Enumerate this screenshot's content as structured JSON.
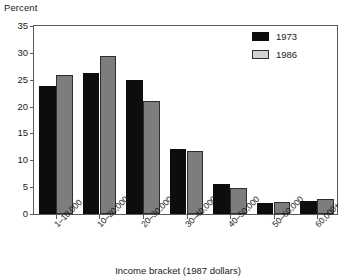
{
  "chart_data": {
    "type": "bar",
    "title": "",
    "xlabel": "Income bracket (1987 dollars)",
    "ylabel": "Percent",
    "categories": [
      "1–10,000",
      "10–20,000",
      "20–30,000",
      "30–40,000",
      "40–50,000",
      "50–60,000",
      "60,000+"
    ],
    "series": [
      {
        "name": "1973",
        "color": "#0d0d0d",
        "values": [
          23.9,
          26.3,
          25.0,
          12.1,
          5.5,
          2.1,
          2.4
        ]
      },
      {
        "name": "1986",
        "color": "#7d7d7d",
        "values": [
          25.8,
          29.4,
          21.0,
          11.7,
          4.8,
          2.3,
          2.8
        ]
      }
    ],
    "ylim": [
      0,
      35
    ],
    "yticks": [
      0,
      5,
      10,
      15,
      20,
      25,
      30,
      35
    ],
    "ytick_labels": [
      "0",
      "5",
      "10",
      "15",
      "20",
      "25",
      "30",
      "35"
    ],
    "grid": false,
    "legend_position": "top-right"
  },
  "legend": {
    "entries": [
      {
        "label": "1973"
      },
      {
        "label": "1986"
      }
    ]
  }
}
